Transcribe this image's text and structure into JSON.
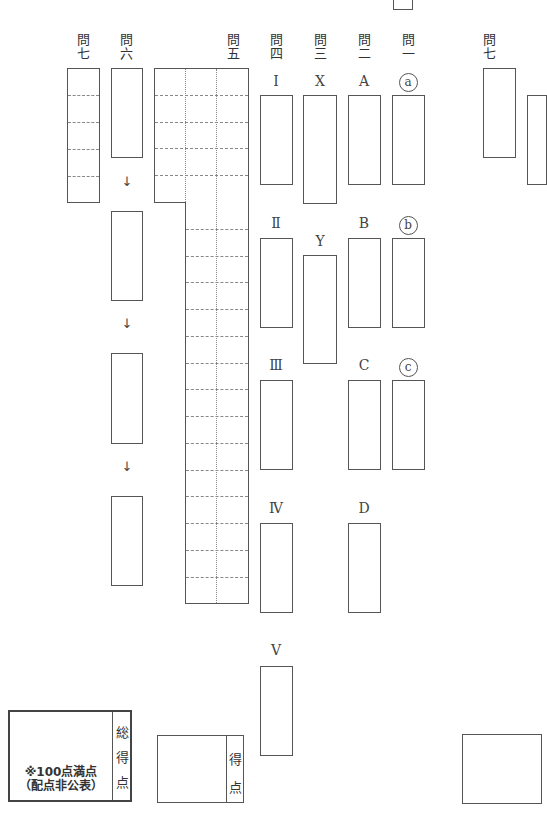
{
  "top_box": {},
  "questions": [
    {
      "id": "q7_left",
      "label": "問七",
      "label_top": "問",
      "label_bottom": "七"
    },
    {
      "id": "q6",
      "label": "問六",
      "label_top": "問",
      "label_bottom": "六"
    },
    {
      "id": "q5",
      "label": "問五",
      "label_top": "問",
      "label_bottom": "五"
    },
    {
      "id": "q4",
      "label": "問四",
      "label_top": "問",
      "label_bottom": "四"
    },
    {
      "id": "q3",
      "label": "問三",
      "label_top": "問",
      "label_bottom": "三"
    },
    {
      "id": "q2",
      "label": "問二",
      "label_top": "問",
      "label_bottom": "二"
    },
    {
      "id": "q1",
      "label": "問一",
      "label_top": "問",
      "label_bottom": "一"
    },
    {
      "id": "q7_right",
      "label": "問七",
      "label_top": "問",
      "label_bottom": "七"
    }
  ],
  "q4_items": [
    "Ⅰ",
    "Ⅱ",
    "Ⅲ",
    "Ⅳ",
    "Ⅴ"
  ],
  "q3_items": [
    "X",
    "Y"
  ],
  "q2_items": [
    "A",
    "B",
    "C",
    "D"
  ],
  "q1_items": [
    "a",
    "b",
    "c"
  ],
  "q6_arrows": [
    "↓",
    "↓",
    "↓"
  ],
  "score_total": {
    "side_label": [
      "総",
      "得",
      "点"
    ],
    "note_line1": "※100点満点",
    "note_line2": "（配点非公表）"
  },
  "score_page": {
    "side_label": [
      "得",
      "点"
    ]
  }
}
